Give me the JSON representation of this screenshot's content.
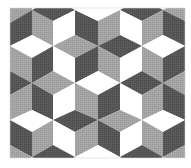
{
  "figure": {
    "width": 191,
    "height": 168,
    "frame": {
      "x": 10,
      "y": 8,
      "w": 175,
      "h": 150
    },
    "colors": {
      "dark": "#575757",
      "mid": "#a3a3a3",
      "light": "#ffffff",
      "edge": "#2a2a2a",
      "background": "#ffffff"
    }
  },
  "tiles": [
    {
      "shade": "mid",
      "points": "10,8 32,8 32,10 10,23"
    },
    {
      "shade": "dark",
      "points": "10,23 32,10 32,35 10,46"
    },
    {
      "shade": "mid",
      "points": "32,10 53,21 53,46 32,35"
    },
    {
      "shade": "dark",
      "points": "32,10 53,-2 75,10 53,21"
    },
    {
      "shade": "light",
      "points": "53,21 75,10 75,35 53,46"
    },
    {
      "shade": "dark",
      "points": "75,10 98,21 98,46 75,35"
    },
    {
      "shade": "light",
      "points": "75,10 98,-2 120,10 98,21"
    },
    {
      "shade": "mid",
      "points": "98,21 120,10 120,35 98,46"
    },
    {
      "shade": "dark",
      "points": "120,10 142,-2 163,10 142,21"
    },
    {
      "shade": "light",
      "points": "120,10 142,21 142,46 120,35"
    },
    {
      "shade": "mid",
      "points": "142,21 163,10 163,35 142,46"
    },
    {
      "shade": "mid",
      "points": "163,10 185,-2 207,10 185,21"
    },
    {
      "shade": "dark",
      "points": "163,10 185,21 185,46 163,35"
    },
    {
      "shade": "light",
      "points": "10,46 32,35 53,46 32,58"
    },
    {
      "shade": "mid",
      "points": "53,46 75,35 98,46 75,58"
    },
    {
      "shade": "dark",
      "points": "98,46 120,35 142,46 120,58"
    },
    {
      "shade": "light",
      "points": "142,46 163,35 185,46 163,58"
    },
    {
      "shade": "mid",
      "points": "10,46 32,58 32,83 10,71"
    },
    {
      "shade": "dark",
      "points": "32,58 53,46 53,71 32,83"
    },
    {
      "shade": "light",
      "points": "53,46 75,58 75,83 53,71"
    },
    {
      "shade": "dark",
      "points": "75,58 98,46 98,71 75,83"
    },
    {
      "shade": "mid",
      "points": "98,46 120,58 120,83 98,71"
    },
    {
      "shade": "light",
      "points": "120,58 142,46 142,71 120,83"
    },
    {
      "shade": "mid",
      "points": "142,46 163,58 163,83 142,71"
    },
    {
      "shade": "dark",
      "points": "163,58 185,46 185,71 163,83"
    },
    {
      "shade": "dark",
      "points": "-12,83 10,71 32,83 10,95"
    },
    {
      "shade": "mid",
      "points": "32,83 53,71 75,83 53,95"
    },
    {
      "shade": "light",
      "points": "75,83 98,71 120,83 98,95"
    },
    {
      "shade": "dark",
      "points": "120,83 142,71 163,83 142,95"
    },
    {
      "shade": "mid",
      "points": "163,83 185,71 207,83 185,95"
    },
    {
      "shade": "mid",
      "points": "10,95 32,83 32,110 10,120"
    },
    {
      "shade": "dark",
      "points": "32,83 53,95 53,120 32,110"
    },
    {
      "shade": "light",
      "points": "53,95 75,83 75,110 53,120"
    },
    {
      "shade": "mid",
      "points": "75,83 98,95 98,120 75,110"
    },
    {
      "shade": "dark",
      "points": "98,95 120,83 120,110 98,120"
    },
    {
      "shade": "light",
      "points": "120,83 142,95 142,120 120,110"
    },
    {
      "shade": "mid",
      "points": "142,95 163,83 163,110 142,120"
    },
    {
      "shade": "dark",
      "points": "163,83 185,95 185,120 163,110"
    },
    {
      "shade": "light",
      "points": "10,120 32,110 53,120 32,132"
    },
    {
      "shade": "dark",
      "points": "53,120 75,110 98,120 75,132"
    },
    {
      "shade": "mid",
      "points": "98,120 120,110 142,120 120,132"
    },
    {
      "shade": "light",
      "points": "142,120 163,110 185,120 163,132"
    },
    {
      "shade": "dark",
      "points": "10,120 32,132 32,157 10,145"
    },
    {
      "shade": "mid",
      "points": "32,132 53,120 53,145 32,157"
    },
    {
      "shade": "light",
      "points": "53,120 75,132 75,157 53,145"
    },
    {
      "shade": "mid",
      "points": "75,132 98,120 98,145 75,157"
    },
    {
      "shade": "dark",
      "points": "98,120 120,132 120,157 98,145"
    },
    {
      "shade": "light",
      "points": "120,132 142,120 142,145 120,157"
    },
    {
      "shade": "mid",
      "points": "142,120 163,132 163,157 142,145"
    },
    {
      "shade": "dark",
      "points": "163,132 185,120 185,145 163,157"
    },
    {
      "shade": "mid",
      "points": "10,145 32,157 10,169"
    },
    {
      "shade": "dark",
      "points": "32,157 53,145 75,157 53,169"
    },
    {
      "shade": "light",
      "points": "75,157 98,145 120,157 98,169"
    },
    {
      "shade": "dark",
      "points": "120,157 142,145 163,157 142,169"
    },
    {
      "shade": "mid",
      "points": "163,157 185,145 207,157 185,169"
    }
  ]
}
